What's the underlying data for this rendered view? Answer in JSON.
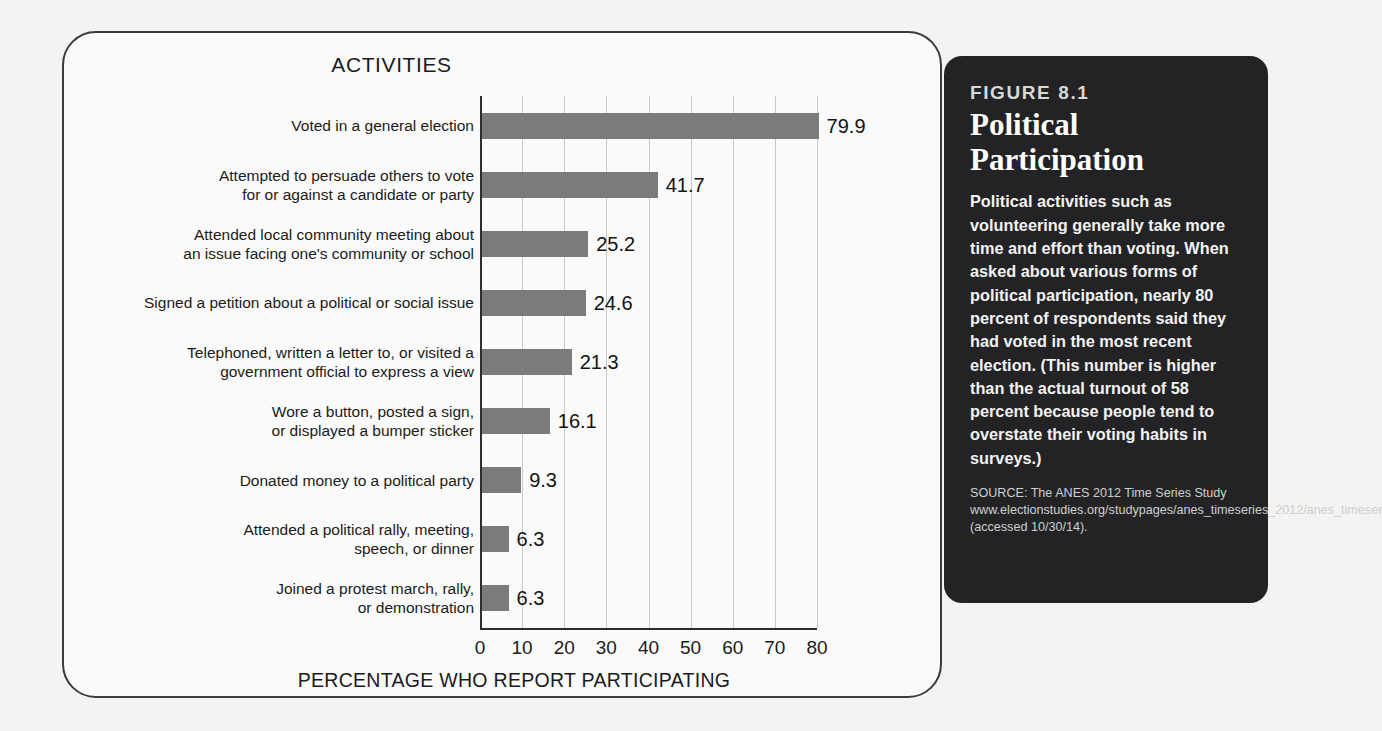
{
  "chart_card": {
    "chart_title": "ACTIVITIES",
    "x_axis_title": "PERCENTAGE WHO REPORT PARTICIPATING"
  },
  "figure_panel": {
    "figure_number": "FIGURE 8.1",
    "figure_title": "Political Participation",
    "caption": "Political activities such as volunteering generally take more time and effort than voting. When asked about various forms of political participation, nearly 80 percent of respondents said they had voted in the most recent election. (This number is higher than the actual turnout of 58 percent because people tend to overstate their voting habits in surveys.)",
    "source": "SOURCE: The ANES 2012 Time Series Study www.electionstudies.org/studypages/anes_timeseries_2012/anes_timeseries_2012.htm (accessed 10/30/14)."
  },
  "chart_data": {
    "type": "bar",
    "orientation": "horizontal",
    "title": "ACTIVITIES",
    "xlabel": "PERCENTAGE WHO REPORT PARTICIPATING",
    "ylabel": "",
    "xlim": [
      0,
      80
    ],
    "xticks": [
      0,
      10,
      20,
      30,
      40,
      50,
      60,
      70,
      80
    ],
    "xtick_labels": [
      "0",
      "10",
      "20",
      "30",
      "40",
      "50",
      "60",
      "70",
      "80"
    ],
    "grid": true,
    "legend": false,
    "bar_color": "#7b7b7b",
    "categories": [
      "Voted in a general election",
      "Attempted to persuade others to vote for or against a candidate or party",
      "Attended local community meeting about an issue facing one's community or school",
      "Signed a petition about a political or social issue",
      "Telephoned, written a letter to, or visited a government official to express a view",
      "Wore a button, posted a sign, or displayed a bumper sticker",
      "Donated money to a political party",
      "Attended a political rally, meeting, speech, or dinner",
      "Joined a protest march, rally, or demonstration"
    ],
    "category_lines": [
      [
        "Voted in a general election"
      ],
      [
        "Attempted to persuade others to vote",
        "for or against a candidate or party"
      ],
      [
        "Attended local community meeting about",
        "an issue facing one's community or school"
      ],
      [
        "Signed a petition about a political or social issue"
      ],
      [
        "Telephoned, written a letter to, or visited a",
        "government official to express a view"
      ],
      [
        "Wore a button, posted a sign,",
        "or displayed a bumper sticker"
      ],
      [
        "Donated money to a political party"
      ],
      [
        "Attended a political rally, meeting,",
        "speech, or dinner"
      ],
      [
        "Joined a protest march, rally,",
        "or demonstration"
      ]
    ],
    "values": [
      79.9,
      41.7,
      25.2,
      24.6,
      21.3,
      16.1,
      9.3,
      6.3,
      6.3
    ],
    "value_labels": [
      "79.9",
      "41.7",
      "25.2",
      "24.6",
      "21.3",
      "16.1",
      "9.3",
      "6.3",
      "6.3"
    ]
  }
}
